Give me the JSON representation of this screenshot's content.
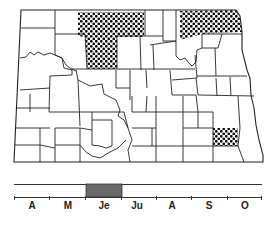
{
  "map": {
    "region": "North Dakota",
    "outline_color": "#222222",
    "stipple_color": "#111111",
    "highlighted_areas": [
      {
        "name": "north-central-block",
        "pattern": "stipple"
      },
      {
        "name": "northeast-block",
        "pattern": "stipple"
      },
      {
        "name": "southeast-county",
        "pattern": "stipple"
      }
    ]
  },
  "timeline": {
    "months": [
      "A",
      "M",
      "Je",
      "Ju",
      "A",
      "S",
      "O"
    ],
    "active_period": {
      "start": "Je",
      "end": "Je"
    },
    "bar_color": "#6a6a6a"
  }
}
